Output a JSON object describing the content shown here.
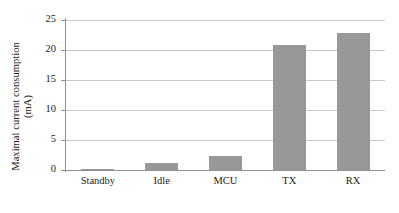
{
  "chart_data": {
    "type": "bar",
    "title": "",
    "xlabel": "",
    "ylabel": "Maximal current consumption (mA)",
    "ylabel_line1": "Maximal current consumption",
    "ylabel_line2": "(mA)",
    "categories": [
      "Standby",
      "Idle",
      "MCU",
      "TX",
      "RX"
    ],
    "values": [
      0.15,
      1.2,
      2.4,
      20.8,
      22.8
    ],
    "unit": "mA",
    "ylim": [
      0,
      25
    ],
    "ytick_labels": [
      "0",
      "5",
      "10",
      "15",
      "20",
      "25"
    ],
    "ytick_values": [
      0,
      5,
      10,
      15,
      20,
      25
    ],
    "grid": true,
    "legend": false,
    "bar_color": "#989898",
    "gridline_color": "#c9c9c9",
    "axis_color": "#8f8f8f",
    "background": "#ffffff"
  }
}
